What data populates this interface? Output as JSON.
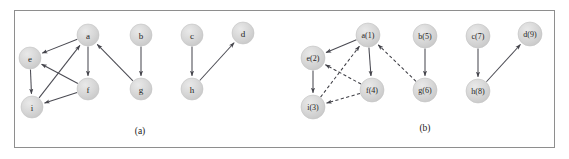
{
  "figure": {
    "width": 569,
    "height": 159,
    "background_color": "#ffffff",
    "border_color": "#8e8e8e",
    "node_fill_color": "#d2d2d2",
    "node_stroke_color": "#c2c2c2",
    "edge_color": "#45454c"
  },
  "panels": [
    {
      "id": "panel-a",
      "caption": "(a)",
      "caption_x": 140,
      "caption_y": 131,
      "node_radius": 11,
      "nodes": [
        {
          "id": "a",
          "label": "a",
          "x": 88,
          "y": 35
        },
        {
          "id": "b",
          "label": "b",
          "x": 141,
          "y": 35
        },
        {
          "id": "c",
          "label": "c",
          "x": 192,
          "y": 35
        },
        {
          "id": "d",
          "label": "d",
          "x": 243,
          "y": 33
        },
        {
          "id": "e",
          "label": "e",
          "x": 30,
          "y": 58
        },
        {
          "id": "f",
          "label": "f",
          "x": 88,
          "y": 89
        },
        {
          "id": "g",
          "label": "g",
          "x": 141,
          "y": 89
        },
        {
          "id": "h",
          "label": "h",
          "x": 192,
          "y": 89
        },
        {
          "id": "i",
          "label": "i",
          "x": 32,
          "y": 107
        }
      ],
      "edges": [
        {
          "from": "a",
          "to": "e",
          "style": "solid"
        },
        {
          "from": "a",
          "to": "f",
          "style": "solid"
        },
        {
          "from": "e",
          "to": "i",
          "style": "solid"
        },
        {
          "from": "f",
          "to": "e",
          "style": "solid"
        },
        {
          "from": "f",
          "to": "i",
          "style": "solid"
        },
        {
          "from": "i",
          "to": "a",
          "style": "solid"
        },
        {
          "from": "g",
          "to": "a",
          "style": "solid"
        },
        {
          "from": "b",
          "to": "g",
          "style": "solid"
        },
        {
          "from": "c",
          "to": "h",
          "style": "solid"
        },
        {
          "from": "h",
          "to": "d",
          "style": "solid"
        }
      ]
    },
    {
      "id": "panel-b",
      "caption": "(b)",
      "caption_x": 425,
      "caption_y": 128,
      "node_radius": 12,
      "nodes": [
        {
          "id": "a",
          "label": "a(1)",
          "x": 368,
          "y": 35
        },
        {
          "id": "b",
          "label": "b(5)",
          "x": 425,
          "y": 36
        },
        {
          "id": "c",
          "label": "c(7)",
          "x": 478,
          "y": 36
        },
        {
          "id": "d",
          "label": "d(9)",
          "x": 530,
          "y": 34
        },
        {
          "id": "e",
          "label": "e(2)",
          "x": 313,
          "y": 58
        },
        {
          "id": "f",
          "label": "f(4)",
          "x": 372,
          "y": 90
        },
        {
          "id": "g",
          "label": "g(6)",
          "x": 425,
          "y": 90
        },
        {
          "id": "h",
          "label": "h(8)",
          "x": 478,
          "y": 91
        },
        {
          "id": "i",
          "label": "i(3)",
          "x": 313,
          "y": 107
        }
      ],
      "edges": [
        {
          "from": "a",
          "to": "e",
          "style": "solid"
        },
        {
          "from": "a",
          "to": "f",
          "style": "solid"
        },
        {
          "from": "e",
          "to": "i",
          "style": "solid"
        },
        {
          "from": "f",
          "to": "e",
          "style": "dashed"
        },
        {
          "from": "f",
          "to": "i",
          "style": "dashed"
        },
        {
          "from": "i",
          "to": "a",
          "style": "dashed"
        },
        {
          "from": "g",
          "to": "a",
          "style": "dashed"
        },
        {
          "from": "b",
          "to": "g",
          "style": "solid"
        },
        {
          "from": "c",
          "to": "h",
          "style": "solid"
        },
        {
          "from": "h",
          "to": "d",
          "style": "solid"
        }
      ]
    }
  ]
}
